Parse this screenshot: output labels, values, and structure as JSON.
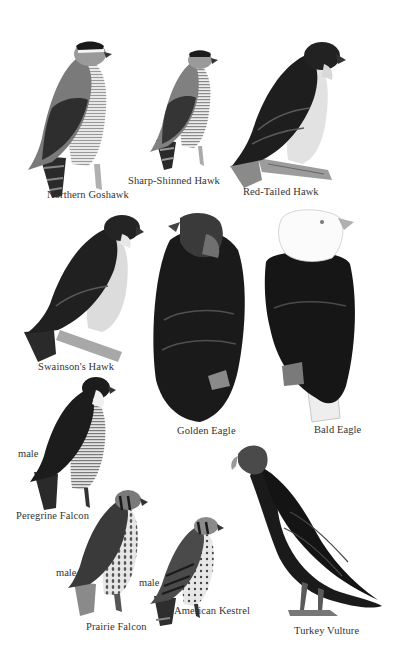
{
  "plate": {
    "background": "#ffffff",
    "ink_dark": "#141414",
    "ink_mid": "#5a5a5a",
    "ink_light": "#b8b8b8",
    "birds": [
      {
        "id": "northern-goshawk",
        "name": "Northern Goshawk",
        "sex": ""
      },
      {
        "id": "sharp-shinned-hawk",
        "name": "Sharp-Shinned Hawk",
        "sex": ""
      },
      {
        "id": "red-tailed-hawk",
        "name": "Red-Tailed Hawk",
        "sex": ""
      },
      {
        "id": "swainsons-hawk",
        "name": "Swainson's Hawk",
        "sex": ""
      },
      {
        "id": "golden-eagle",
        "name": "Golden Eagle",
        "sex": ""
      },
      {
        "id": "bald-eagle",
        "name": "Bald Eagle",
        "sex": ""
      },
      {
        "id": "peregrine-falcon",
        "name": "Peregrine Falcon",
        "sex": "male"
      },
      {
        "id": "prairie-falcon",
        "name": "Prairie Falcon",
        "sex": "male"
      },
      {
        "id": "american-kestrel",
        "name": "American Kestrel",
        "sex": "male"
      },
      {
        "id": "turkey-vulture",
        "name": "Turkey Vulture",
        "sex": ""
      }
    ]
  }
}
